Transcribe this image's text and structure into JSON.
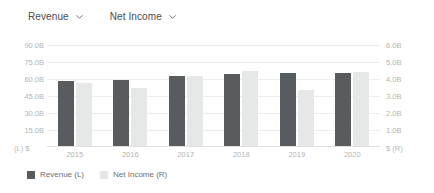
{
  "toolbar": {
    "selectors": [
      {
        "label": "Revenue",
        "icon": "chevron-down-icon"
      },
      {
        "label": "Net Income",
        "icon": "chevron-down-icon"
      }
    ]
  },
  "axes": {
    "left_unit": "(L)  $",
    "right_unit": "$  (R)",
    "left_ticks": [
      "90.0B",
      "75.0B",
      "60.0B",
      "45.0B",
      "30.0B",
      "15.0B"
    ],
    "right_ticks": [
      "6.0B",
      "5.0B",
      "4.0B",
      "3.0B",
      "2.0B",
      "1.0B"
    ]
  },
  "legend": {
    "items": [
      {
        "label": "Revenue (L)",
        "color": "#585c5e"
      },
      {
        "label": "Net Income (R)",
        "color": "#e6e7e7"
      }
    ]
  },
  "colors": {
    "revenue": "#585c5e",
    "net_income": "#e6e7e7",
    "grid": "#ededed",
    "axis_text": "#b4b4b4",
    "label_text": "#4b4b4b"
  },
  "chart_data": {
    "type": "bar",
    "title": "",
    "xlabel": "",
    "categories": [
      "2015",
      "2016",
      "2017",
      "2018",
      "2019",
      "2020"
    ],
    "grid": true,
    "legend_position": "bottom-left",
    "series": [
      {
        "name": "Revenue (L)",
        "axis": "left",
        "unit": "$",
        "ylabel": "(L)  $",
        "ylim": [
          0,
          90000000000
        ],
        "ytick_labels": [
          "15.0B",
          "30.0B",
          "45.0B",
          "60.0B",
          "75.0B",
          "90.0B"
        ],
        "ytick_values": [
          15000000000,
          30000000000,
          45000000000,
          60000000000,
          75000000000,
          90000000000
        ],
        "values": [
          58000000000,
          59500000000,
          62500000000,
          64000000000,
          65000000000,
          65000000000
        ],
        "value_labels": [
          "58.0B",
          "59.5B",
          "62.5B",
          "64.0B",
          "65.0B",
          "65.0B"
        ],
        "color": "#585c5e"
      },
      {
        "name": "Net Income (R)",
        "axis": "right",
        "unit": "$",
        "ylabel": "$  (R)",
        "ylim": [
          0,
          6000000000
        ],
        "ytick_labels": [
          "1.0B",
          "2.0B",
          "3.0B",
          "4.0B",
          "5.0B",
          "6.0B"
        ],
        "ytick_values": [
          1000000000,
          2000000000,
          3000000000,
          4000000000,
          5000000000,
          6000000000
        ],
        "values": [
          3750000000,
          3500000000,
          4150000000,
          4500000000,
          3350000000,
          4400000000
        ],
        "value_labels": [
          "3.75B",
          "3.50B",
          "4.15B",
          "4.50B",
          "3.35B",
          "4.40B"
        ],
        "color": "#e6e7e7"
      }
    ]
  }
}
